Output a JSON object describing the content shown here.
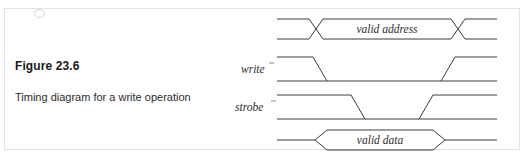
{
  "figure": {
    "number": "Figure 23.6",
    "caption": "Timing diagram for a write operation"
  },
  "diagram": {
    "type": "timing-diagram",
    "signals": [
      {
        "name": "address-bus",
        "label": "",
        "style": "bus",
        "bus_value": "valid address",
        "row_y": 22,
        "description": "Address bus: invalid before first crossing, valid address between crossings, invalid after second crossing"
      },
      {
        "name": "write",
        "label": "write",
        "label_mark": "'",
        "style": "logic",
        "row_y": 60,
        "description": "Active-low write strobe: high, falls early, stays low through the cycle, rises late"
      },
      {
        "name": "strobe",
        "label": "strobe",
        "label_mark": "'",
        "style": "logic",
        "row_y": 98,
        "description": "Active-low strobe: high, falls after write falls, rises before write rises"
      },
      {
        "name": "data-bus",
        "label": "",
        "style": "bus-single",
        "bus_value": "valid  data",
        "row_y": 132,
        "description": "Data bus: single level, opens to valid data window, closes back to single level"
      }
    ],
    "colors": {
      "line": "#3b3b3b",
      "text": "#2e2e2e",
      "border": "#e2e2e2",
      "background": "#ffffff"
    }
  }
}
